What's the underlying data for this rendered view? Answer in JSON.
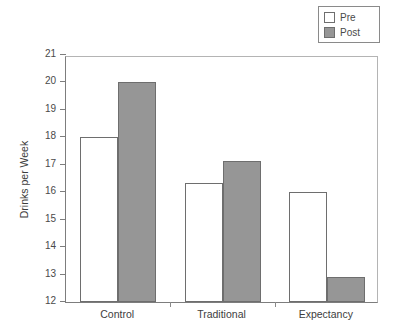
{
  "chart_data": {
    "type": "bar",
    "title": "",
    "xlabel": "",
    "ylabel": "Drinks per Week",
    "categories": [
      "Control",
      "Traditional",
      "Expectancy"
    ],
    "series": [
      {
        "name": "Pre",
        "color": "#ffffff",
        "values": [
          18.0,
          16.35,
          16.0
        ]
      },
      {
        "name": "Post",
        "color": "#969696",
        "values": [
          20.0,
          17.15,
          12.9
        ]
      }
    ],
    "ylim": [
      12,
      21
    ],
    "yticks": [
      12,
      13,
      14,
      15,
      16,
      17,
      18,
      19,
      20,
      21
    ],
    "ytick_labels": [
      "12",
      "13",
      "14",
      "15",
      "16",
      "17",
      "18",
      "19",
      "20",
      "21"
    ],
    "grid": false,
    "legend_position": "top-right",
    "legend_entries": [
      "Pre",
      "Post"
    ]
  },
  "legend": {
    "pre_label": "Pre",
    "post_label": "Post"
  },
  "axes": {
    "y_title": "Drinks per Week",
    "y_labels": [
      "21",
      "20",
      "19",
      "18",
      "17",
      "16",
      "15",
      "14",
      "13",
      "12"
    ],
    "x_labels": [
      "Control",
      "Traditional",
      "Expectancy"
    ]
  }
}
